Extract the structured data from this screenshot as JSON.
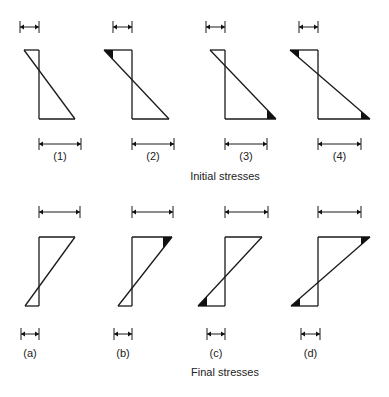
{
  "diagram": {
    "rows": [
      {
        "id": "initial",
        "caption": "Initial stresses",
        "caption_pos": [
          225,
          170
        ],
        "top_y": 50,
        "bottom_y": 119,
        "top_arrow_y": 27,
        "bottom_arrow_y": 144,
        "label_y": 150,
        "orientation": "decreasing",
        "items": [
          {
            "label": "(1)",
            "axis_x": 39,
            "left_x": 24,
            "right_x": 75,
            "top_dim": [
              20,
              39
            ],
            "bottom_dim": [
              39,
              81
            ],
            "shaded": []
          },
          {
            "label": "(2)",
            "axis_x": 132,
            "left_x": 104,
            "right_x": 169,
            "top_dim": [
              113,
              132
            ],
            "bottom_dim": [
              132,
              174
            ],
            "shaded": [
              "top-left"
            ]
          },
          {
            "label": "(3)",
            "axis_x": 225,
            "left_x": 210,
            "right_x": 276,
            "top_dim": [
              206,
              225
            ],
            "bottom_dim": [
              225,
              267
            ],
            "shaded": [
              "bottom-right"
            ]
          },
          {
            "label": "(4)",
            "axis_x": 318,
            "left_x": 290,
            "right_x": 370,
            "top_dim": [
              299,
              318
            ],
            "bottom_dim": [
              318,
              361
            ],
            "shaded": [
              "top-left",
              "bottom-right"
            ]
          }
        ]
      },
      {
        "id": "final",
        "caption": "Final stresses",
        "caption_pos": [
          225,
          366
        ],
        "top_y": 237,
        "bottom_y": 306,
        "top_arrow_y": 212,
        "bottom_arrow_y": 334,
        "label_y": 347,
        "orientation": "increasing",
        "items": [
          {
            "label": "(a)",
            "axis_x": 39,
            "left_x": 25,
            "right_x": 75,
            "top_dim": [
              39,
              80
            ],
            "bottom_dim": [
              21,
              39
            ],
            "shaded": []
          },
          {
            "label": "(b)",
            "axis_x": 132,
            "left_x": 118,
            "right_x": 172,
            "top_dim": [
              132,
              173
            ],
            "bottom_dim": [
              114,
              132
            ],
            "shaded": [
              "top-right"
            ]
          },
          {
            "label": "(c)",
            "axis_x": 225,
            "left_x": 198,
            "right_x": 262,
            "top_dim": [
              225,
              268
            ],
            "bottom_dim": [
              207,
              225
            ],
            "shaded": [
              "bottom-left"
            ]
          },
          {
            "label": "(d)",
            "axis_x": 318,
            "left_x": 291,
            "right_x": 370,
            "top_dim": [
              318,
              361
            ],
            "bottom_dim": [
              301,
              320
            ],
            "shaded": [
              "top-right",
              "bottom-left"
            ]
          }
        ]
      }
    ],
    "colors": {
      "line": "#1a1a1a",
      "fill": "#111111",
      "text": "#222222"
    }
  }
}
